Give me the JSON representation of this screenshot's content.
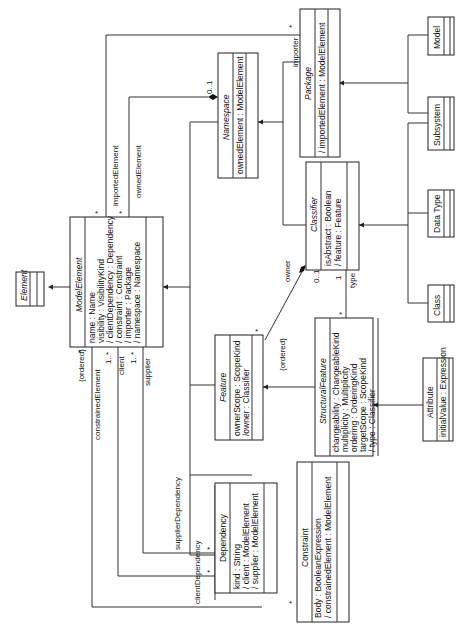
{
  "classes": {
    "element": {
      "name": "Element"
    },
    "model_element": {
      "name": "ModelElement",
      "attributes": [
        "name : Name",
        "visibility : VisibilityKind",
        "/ clientDependency : Dependency",
        "/ constraint : Constraint",
        "/ importer : Package",
        "/ namespace : Namespace"
      ]
    },
    "namespace": {
      "name": "Namespace",
      "attributes": [
        "ownedElement : ModelElement"
      ]
    },
    "package": {
      "name": "Package",
      "attributes": [
        "/ importedElement : ModelElement"
      ]
    },
    "model": {
      "name": "Model"
    },
    "subsystem": {
      "name": "Subsystem"
    },
    "classifier": {
      "name": "Classifier",
      "attributes": [
        "isAbstract : Boolean",
        "/ feature : Feature"
      ]
    },
    "data_type": {
      "name": "Data Type"
    },
    "class": {
      "name": "Class"
    },
    "feature": {
      "name": "Feature",
      "attributes": [
        "ownerScope : ScopeKind",
        "/owner : Classifier"
      ]
    },
    "structural_feature": {
      "name": "StructuralFeature",
      "attributes": [
        "changeability : ChangeableKind",
        "multiplicity : Multiplicity",
        "ordering : OrderingKind",
        "targetScope : ScopeKind",
        "/ type : Classifier"
      ]
    },
    "attribute": {
      "name": "Attribute",
      "attributes": [
        "initialValue : Expression"
      ]
    },
    "dependency": {
      "name": "Dependency",
      "attributes": [
        "kind : String",
        "/ client : ModelElement",
        "/ supplier : ModelElement"
      ]
    },
    "constraint": {
      "name": "Constraint",
      "attributes": [
        "Body : BooleanExpression",
        "/ constrainedElement : ModelElement"
      ]
    }
  },
  "labels": {
    "imported_element": "importedElement",
    "owned_element": "ownedElement",
    "importer": "importer",
    "namespace_mult": "0..1",
    "owner": "owner",
    "owner_mult": "0..1",
    "type": "type",
    "type_mult": "1",
    "ordered_feature": "{ordered}",
    "ordered_constraint": "{ordered}",
    "constrained_element": "constrainedElement",
    "client": "client",
    "supplier": "supplier",
    "supplier_dependency": "supplierDependency",
    "client_dependency": "clientDependency",
    "one_many_1": "1..*",
    "one_many_2": "1..*",
    "star": "*"
  }
}
